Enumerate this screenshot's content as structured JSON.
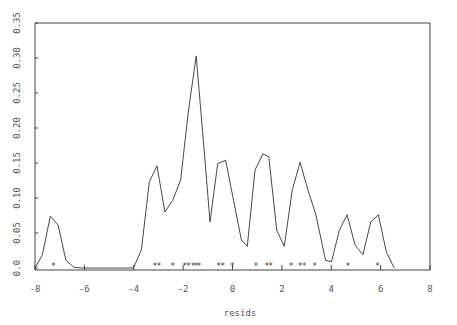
{
  "chart_data": {
    "type": "line",
    "title": "",
    "xlabel": "resids",
    "ylabel": "",
    "xlim": [
      -8,
      8
    ],
    "ylim": [
      0.0,
      0.35
    ],
    "grid": false,
    "legend": null,
    "x_ticks": [
      -8,
      -6,
      -4,
      -2,
      0,
      2,
      4,
      6,
      8
    ],
    "x_tick_labels": [
      "-8",
      "-6",
      "-4",
      "-2",
      "0",
      "2",
      "4",
      "6",
      "8"
    ],
    "y_ticks": [
      0.0,
      0.05,
      0.1,
      0.15,
      0.2,
      0.25,
      0.3,
      0.35
    ],
    "y_tick_labels": [
      "0.0",
      "0.05",
      "0.10",
      "0.15",
      "0.20",
      "0.25",
      "0.30",
      "0.35"
    ],
    "series": [
      {
        "name": "density",
        "x": [
          -8.0,
          -7.7,
          -7.38,
          -7.06,
          -6.75,
          -6.43,
          -6.11,
          -4.01,
          -3.69,
          -3.37,
          -3.06,
          -2.74,
          -2.42,
          -2.1,
          -1.79,
          -1.47,
          -1.15,
          -0.91,
          -0.6,
          -0.28,
          0.04,
          0.36,
          0.6,
          0.91,
          1.23,
          1.47,
          1.79,
          2.1,
          2.42,
          2.74,
          3.06,
          3.37,
          3.77,
          4.01,
          4.33,
          4.64,
          4.96,
          5.28,
          5.6,
          5.91,
          6.23,
          6.55
        ],
        "y": [
          0.0,
          0.019,
          0.074,
          0.061,
          0.011,
          0.001,
          0.0,
          0.0,
          0.026,
          0.123,
          0.146,
          0.08,
          0.097,
          0.126,
          0.223,
          0.303,
          0.169,
          0.066,
          0.149,
          0.154,
          0.097,
          0.04,
          0.031,
          0.14,
          0.163,
          0.159,
          0.054,
          0.031,
          0.111,
          0.151,
          0.111,
          0.077,
          0.011,
          0.009,
          0.054,
          0.076,
          0.033,
          0.019,
          0.066,
          0.076,
          0.023,
          0.0
        ]
      }
    ],
    "rug": {
      "symbol": "*",
      "x": [
        -7.25,
        -3.14,
        -2.98,
        -2.42,
        -1.94,
        -1.79,
        -1.59,
        -1.47,
        -1.35,
        -0.56,
        -0.4,
        0.0,
        0.95,
        1.39,
        1.55,
        2.38,
        2.74,
        2.9,
        3.33,
        4.68,
        5.87
      ]
    }
  }
}
